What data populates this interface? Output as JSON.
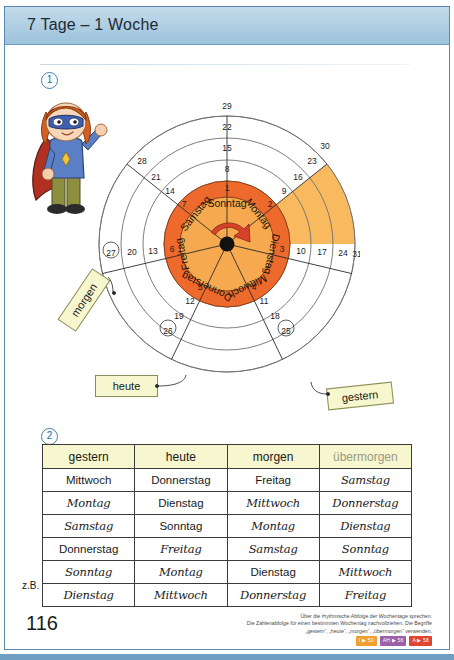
{
  "header": {
    "title": "7 Tage – 1 Woche"
  },
  "tasks": {
    "one": "1",
    "two": "2"
  },
  "wheel": {
    "days": [
      "Sonntag",
      "Montag",
      "Dienstag",
      "Mittwoch",
      "Donnerstag",
      "Freitag",
      "Samstag"
    ],
    "inner_numbers": [
      1,
      2,
      3,
      4,
      5,
      6,
      7
    ],
    "ring_numbers": {
      "Sonntag": [
        1,
        8,
        15,
        22,
        29
      ],
      "Montag": [
        2,
        9,
        16,
        23,
        30
      ],
      "Dienstag": [
        3,
        10,
        17,
        24,
        31
      ],
      "Mittwoch": [
        4,
        11,
        18,
        25
      ],
      "Donnerstag": [
        5,
        12,
        19,
        26
      ],
      "Freitag": [
        6,
        13,
        20,
        27
      ],
      "Samstag": [
        7,
        14,
        21,
        28
      ]
    },
    "circled_numbers": [
      25,
      26,
      27
    ],
    "highlighted_day": "Montag",
    "hub_icon": "rotation-arrow-icon",
    "colors": {
      "inner_wedge": "#f6a94e",
      "inner_ring": "#ed6a2c",
      "highlight": "#f9b95f",
      "outline": "#6b5a48"
    }
  },
  "callouts": {
    "morgen": {
      "label": "morgen",
      "points_to": 27
    },
    "heute": {
      "label": "heute",
      "points_to": 26
    },
    "gestern": {
      "label": "gestern",
      "points_to": 25
    }
  },
  "hero": {
    "name": "superhero-kid-illustration"
  },
  "table": {
    "headers": [
      "gestern",
      "heute",
      "morgen",
      "übermorgen"
    ],
    "header_faint_index": 3,
    "rows": [
      {
        "cells": [
          "Mittwoch",
          "Donnerstag",
          "Freitag",
          "Samstag"
        ],
        "answers": [
          false,
          false,
          false,
          true
        ]
      },
      {
        "cells": [
          "Montag",
          "Dienstag",
          "Mittwoch",
          "Donnerstag"
        ],
        "answers": [
          true,
          false,
          true,
          true
        ]
      },
      {
        "cells": [
          "Samstag",
          "Sonntag",
          "Montag",
          "Dienstag"
        ],
        "answers": [
          true,
          false,
          true,
          true
        ]
      },
      {
        "cells": [
          "Donnerstag",
          "Freitag",
          "Samstag",
          "Sonntag"
        ],
        "answers": [
          false,
          true,
          true,
          true
        ]
      },
      {
        "cells": [
          "Sonntag",
          "Montag",
          "Dienstag",
          "Mittwoch"
        ],
        "answers": [
          true,
          true,
          false,
          true
        ]
      },
      {
        "cells": [
          "Dienstag",
          "Mittwoch",
          "Donnerstag",
          "Freitag"
        ],
        "answers": [
          true,
          true,
          true,
          true
        ]
      }
    ],
    "example_label": "z.B."
  },
  "footer": {
    "page_number": "116",
    "note_line_1": "Über die rhythmische Abfolge der Wochentage sprechen.",
    "note_line_2": "Die Zahlenabfolge für einen bestimmten Wochentag nachvollziehen. Die Begriffe",
    "note_line_3": "„gestern“, „heute“, „morgen“, „übermorgen“ verwenden.",
    "badges": [
      {
        "text": "I ▶ 50",
        "color": "#f0a030"
      },
      {
        "text": "AH ▶ 56",
        "color": "#9c5fa8"
      },
      {
        "text": "A ▶ 58",
        "color": "#e0452f"
      }
    ]
  }
}
